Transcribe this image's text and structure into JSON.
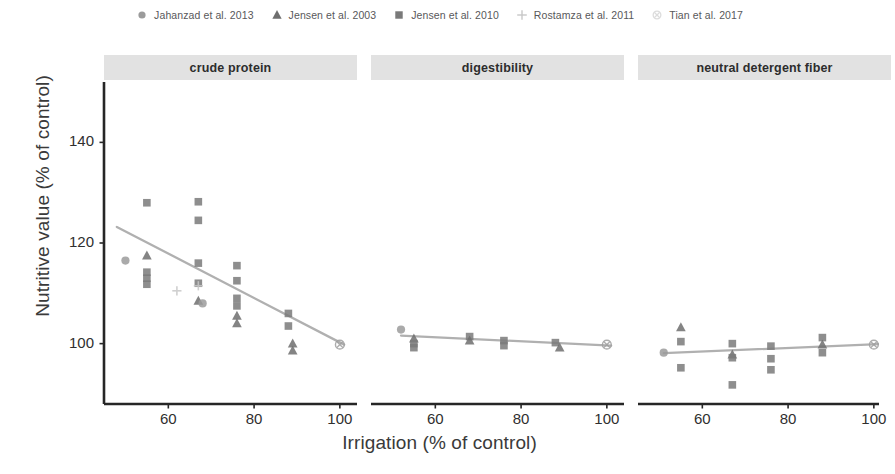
{
  "figure": {
    "axis_titles": {
      "y": "Nutritive value (% of control)",
      "x": "Irrigation (% of control)"
    }
  },
  "legend": {
    "position": "top",
    "entries": [
      {
        "label": "Jahanzad et al. 2013",
        "marker": "filled-circle-icon",
        "color": "#9b9b9b"
      },
      {
        "label": "Jensen et al. 2003",
        "marker": "filled-triangle-icon",
        "color": "#6e6e6e"
      },
      {
        "label": "Jensen et al. 2010",
        "marker": "filled-square-icon",
        "color": "#7a7a7a"
      },
      {
        "label": "Rostamza et al. 2011",
        "marker": "plus-icon",
        "color": "#c8c8c8"
      },
      {
        "label": "Tian et al. 2017",
        "marker": "crossed-circle-icon",
        "color": "#dcdcdc"
      }
    ]
  },
  "chart_data": {
    "type": "scatter",
    "title": "",
    "xlabel": "Irrigation (% of control)",
    "ylabel": "Nutritive value (% of control)",
    "xlim": [
      45,
      104
    ],
    "ylim": [
      88,
      152
    ],
    "xticks": [
      60,
      80,
      100
    ],
    "yticks": [
      100,
      120,
      140
    ],
    "grid": false,
    "facets": [
      {
        "name": "crude protein",
        "trend": {
          "x": [
            48,
            101
          ],
          "y": [
            123.2,
            99.8
          ],
          "color": "#b0b0b0"
        },
        "points": [
          {
            "x": 50,
            "y": 116.5,
            "series": "Jahanzad et al. 2013"
          },
          {
            "x": 55,
            "y": 128.0,
            "series": "Jensen et al. 2010"
          },
          {
            "x": 55,
            "y": 117.5,
            "series": "Jensen et al. 2003"
          },
          {
            "x": 55,
            "y": 114.2,
            "series": "Jensen et al. 2010"
          },
          {
            "x": 55,
            "y": 113.0,
            "series": "Jensen et al. 2010"
          },
          {
            "x": 55,
            "y": 111.8,
            "series": "Jensen et al. 2010"
          },
          {
            "x": 67,
            "y": 128.2,
            "series": "Jensen et al. 2010"
          },
          {
            "x": 67,
            "y": 124.5,
            "series": "Jensen et al. 2010"
          },
          {
            "x": 67,
            "y": 116.0,
            "series": "Jensen et al. 2010"
          },
          {
            "x": 67,
            "y": 112.0,
            "series": "Jensen et al. 2010"
          },
          {
            "x": 67,
            "y": 111.5,
            "series": "Rostamza et al. 2011"
          },
          {
            "x": 67,
            "y": 108.5,
            "series": "Jensen et al. 2003"
          },
          {
            "x": 68,
            "y": 108.0,
            "series": "Jahanzad et al. 2013"
          },
          {
            "x": 62,
            "y": 110.5,
            "series": "Rostamza et al. 2011"
          },
          {
            "x": 76,
            "y": 115.5,
            "series": "Jensen et al. 2010"
          },
          {
            "x": 76,
            "y": 112.5,
            "series": "Jensen et al. 2010"
          },
          {
            "x": 76,
            "y": 109.0,
            "series": "Jensen et al. 2010"
          },
          {
            "x": 76,
            "y": 107.5,
            "series": "Jensen et al. 2010"
          },
          {
            "x": 76,
            "y": 105.5,
            "series": "Jensen et al. 2003"
          },
          {
            "x": 76,
            "y": 104.0,
            "series": "Jensen et al. 2003"
          },
          {
            "x": 88,
            "y": 106.0,
            "series": "Jensen et al. 2010"
          },
          {
            "x": 88,
            "y": 103.5,
            "series": "Jensen et al. 2010"
          },
          {
            "x": 89,
            "y": 100.0,
            "series": "Jensen et al. 2003"
          },
          {
            "x": 89,
            "y": 98.6,
            "series": "Jensen et al. 2003"
          },
          {
            "x": 100,
            "y": 99.8,
            "series": "Tian et al. 2017"
          }
        ]
      },
      {
        "name": "digestibility",
        "trend": {
          "x": [
            52,
            101
          ],
          "y": [
            101.6,
            99.6
          ],
          "color": "#b0b0b0"
        },
        "points": [
          {
            "x": 52,
            "y": 102.8,
            "series": "Jahanzad et al. 2013"
          },
          {
            "x": 55,
            "y": 101.0,
            "series": "Jensen et al. 2003"
          },
          {
            "x": 55,
            "y": 100.0,
            "series": "Jensen et al. 2010"
          },
          {
            "x": 55,
            "y": 99.2,
            "series": "Jensen et al. 2010"
          },
          {
            "x": 68,
            "y": 101.4,
            "series": "Jensen et al. 2010"
          },
          {
            "x": 68,
            "y": 100.6,
            "series": "Jensen et al. 2003"
          },
          {
            "x": 76,
            "y": 100.6,
            "series": "Jensen et al. 2010"
          },
          {
            "x": 76,
            "y": 99.6,
            "series": "Jensen et al. 2010"
          },
          {
            "x": 88,
            "y": 100.2,
            "series": "Jensen et al. 2010"
          },
          {
            "x": 89,
            "y": 99.2,
            "series": "Jensen et al. 2003"
          },
          {
            "x": 100,
            "y": 99.8,
            "series": "Tian et al. 2017"
          }
        ]
      },
      {
        "name": "neutral detergent fiber",
        "trend": {
          "x": [
            51,
            101
          ],
          "y": [
            98.1,
            99.9
          ],
          "color": "#b0b0b0"
        },
        "points": [
          {
            "x": 51,
            "y": 98.2,
            "series": "Jahanzad et al. 2013"
          },
          {
            "x": 55,
            "y": 103.2,
            "series": "Jensen et al. 2003"
          },
          {
            "x": 55,
            "y": 100.4,
            "series": "Jensen et al. 2010"
          },
          {
            "x": 55,
            "y": 95.2,
            "series": "Jensen et al. 2010"
          },
          {
            "x": 67,
            "y": 100.0,
            "series": "Jensen et al. 2010"
          },
          {
            "x": 67,
            "y": 97.8,
            "series": "Jensen et al. 2003"
          },
          {
            "x": 67,
            "y": 97.2,
            "series": "Jensen et al. 2010"
          },
          {
            "x": 67,
            "y": 91.8,
            "series": "Jensen et al. 2010"
          },
          {
            "x": 76,
            "y": 99.5,
            "series": "Jensen et al. 2010"
          },
          {
            "x": 76,
            "y": 97.0,
            "series": "Jensen et al. 2010"
          },
          {
            "x": 76,
            "y": 94.8,
            "series": "Jensen et al. 2010"
          },
          {
            "x": 88,
            "y": 101.2,
            "series": "Jensen et al. 2010"
          },
          {
            "x": 88,
            "y": 99.8,
            "series": "Jensen et al. 2003"
          },
          {
            "x": 88,
            "y": 98.2,
            "series": "Jensen et al. 2010"
          },
          {
            "x": 100,
            "y": 99.8,
            "series": "Tian et al. 2017"
          }
        ]
      }
    ]
  }
}
